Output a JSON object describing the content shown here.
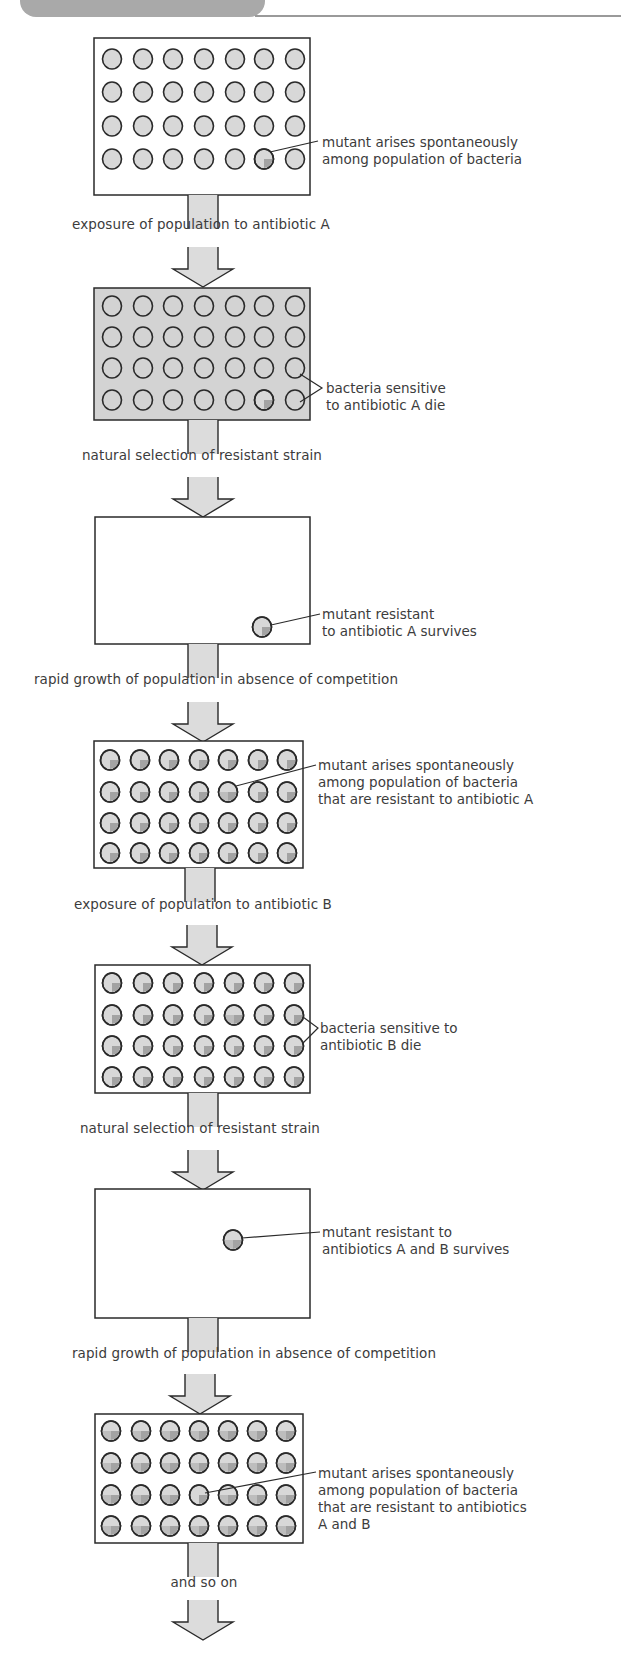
{
  "header": {
    "title_fragment": "Rapid evolution of resistance"
  },
  "colors": {
    "outline": "#2a2a2a",
    "cell_fill": "#d6d6d6",
    "mutant_marker": "#9a9a9a",
    "dead_background": "#d3d3d3",
    "arrow_fill": "#dcdcdc",
    "header_tab": "#a9a9a9"
  },
  "steps": [
    {
      "label": "exposure of population to antibiotic A"
    },
    {
      "label": "natural selection of resistant strain"
    },
    {
      "label": "rapid growth of population in absence of competition"
    },
    {
      "label": "exposure of population to antibiotic B"
    },
    {
      "label": "natural selection of resistant strain"
    },
    {
      "label": "rapid growth of population in absence of competition"
    },
    {
      "label": "and so on"
    }
  ],
  "panels": [
    {
      "id": 1,
      "state": "population",
      "annotation": "mutant arises spontaneously\namong population of bacteria",
      "grid": "4x7"
    },
    {
      "id": 2,
      "state": "dying",
      "annotation": "bacteria sensitive\nto antibiotic A die",
      "grid": "4x7"
    },
    {
      "id": 3,
      "state": "survivor",
      "annotation": "mutant resistant\nto antibiotic A survives"
    },
    {
      "id": 4,
      "state": "population",
      "annotation": "mutant arises spontaneously\namong population of bacteria\nthat are resistant to antibiotic A",
      "grid": "4x7"
    },
    {
      "id": 5,
      "state": "dying",
      "annotation": "bacteria sensitive to\nantibiotic B die",
      "grid": "4x7"
    },
    {
      "id": 6,
      "state": "survivor",
      "annotation": "mutant resistant to\nantibiotics A and B survives"
    },
    {
      "id": 7,
      "state": "population",
      "annotation": "mutant arises spontaneously\namong population of bacteria\nthat are resistant to antibiotics\nA and B",
      "grid": "4x7"
    }
  ]
}
